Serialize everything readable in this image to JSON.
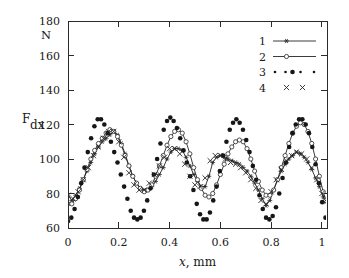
{
  "chart_data": {
    "type": "line",
    "title": "",
    "xlabel": "x, mm",
    "ylabel": "F_dx",
    "ylabel_main": "F",
    "ylabel_sub": "dx",
    "yunit": "N",
    "xlim": [
      0,
      1.02
    ],
    "ylim": [
      60,
      180
    ],
    "xticks": [
      0,
      0.2,
      0.4,
      0.6,
      0.8,
      1
    ],
    "xticklabels": [
      "0",
      "0.2",
      "0.4",
      "0.6",
      "0.8",
      "1"
    ],
    "yticks": [
      60,
      80,
      100,
      120,
      140,
      160,
      180
    ],
    "yticklabels": [
      "60",
      "80",
      "100",
      "120",
      "140",
      "160",
      "180"
    ],
    "grid": false,
    "legend_position": "top-right",
    "legend": [
      {
        "label": "1",
        "marker": "star",
        "line": "solid"
      },
      {
        "label": "2",
        "marker": "circle-open",
        "line": "solid"
      },
      {
        "label": "3",
        "marker": "dot-filled",
        "line": "dotted"
      },
      {
        "label": "4",
        "marker": "cross",
        "line": "none"
      }
    ],
    "series": [
      {
        "name": "1",
        "marker": "star",
        "line": "solid",
        "x": [
          0.0,
          0.015,
          0.03,
          0.045,
          0.06,
          0.075,
          0.09,
          0.105,
          0.12,
          0.135,
          0.15,
          0.165,
          0.18,
          0.195,
          0.21,
          0.225,
          0.24,
          0.255,
          0.27,
          0.285,
          0.3,
          0.315,
          0.33,
          0.345,
          0.36,
          0.375,
          0.39,
          0.405,
          0.42,
          0.435,
          0.45,
          0.465,
          0.48,
          0.495,
          0.51,
          0.525,
          0.54,
          0.555,
          0.57,
          0.585,
          0.6,
          0.615,
          0.63,
          0.645,
          0.66,
          0.675,
          0.69,
          0.705,
          0.72,
          0.735,
          0.75,
          0.765,
          0.78,
          0.795,
          0.81,
          0.825,
          0.84,
          0.855,
          0.87,
          0.885,
          0.9,
          0.915,
          0.93,
          0.945,
          0.96,
          0.975,
          0.99,
          1.005,
          1.015
        ],
        "y": [
          79,
          76,
          79,
          83,
          88,
          93,
          98,
          103,
          107,
          110,
          112,
          114,
          116,
          114,
          109,
          103,
          96,
          90,
          86,
          83,
          82,
          82,
          84,
          87,
          91,
          95,
          100,
          104,
          106,
          106,
          105,
          101,
          96,
          91,
          87,
          84,
          84,
          90,
          98,
          101,
          102,
          101,
          100,
          99,
          98,
          97,
          95,
          93,
          90,
          86,
          82,
          77,
          73,
          76,
          82,
          88,
          93,
          97,
          100,
          102,
          104,
          103,
          101,
          98,
          94,
          89,
          84,
          78,
          75
        ]
      },
      {
        "name": "2",
        "marker": "circle-open",
        "line": "solid",
        "x": [
          0.0,
          0.015,
          0.03,
          0.045,
          0.06,
          0.075,
          0.09,
          0.105,
          0.12,
          0.135,
          0.15,
          0.165,
          0.18,
          0.195,
          0.21,
          0.225,
          0.24,
          0.255,
          0.27,
          0.285,
          0.3,
          0.315,
          0.33,
          0.345,
          0.36,
          0.375,
          0.39,
          0.405,
          0.42,
          0.435,
          0.45,
          0.465,
          0.48,
          0.495,
          0.51,
          0.525,
          0.54,
          0.555,
          0.57,
          0.585,
          0.6,
          0.615,
          0.63,
          0.645,
          0.66,
          0.675,
          0.69,
          0.705,
          0.72,
          0.735,
          0.75,
          0.765,
          0.78,
          0.795,
          0.81,
          0.825,
          0.84,
          0.855,
          0.87,
          0.885,
          0.9,
          0.915,
          0.93,
          0.945,
          0.96,
          0.975,
          0.99,
          1.005,
          1.015
        ],
        "y": [
          74,
          74,
          77,
          82,
          88,
          94,
          100,
          105,
          109,
          112,
          115,
          117,
          116,
          113,
          108,
          102,
          96,
          90,
          86,
          83,
          81,
          82,
          85,
          90,
          96,
          102,
          108,
          113,
          116,
          117,
          115,
          110,
          103,
          95,
          88,
          83,
          79,
          78,
          80,
          85,
          91,
          97,
          103,
          107,
          110,
          111,
          110,
          106,
          100,
          93,
          87,
          82,
          79,
          79,
          82,
          88,
          95,
          102,
          109,
          115,
          119,
          121,
          120,
          116,
          109,
          100,
          90,
          81,
          76
        ]
      },
      {
        "name": "3",
        "marker": "dot-filled",
        "line": "dotted",
        "x": [
          0.0,
          0.013,
          0.026,
          0.039,
          0.052,
          0.065,
          0.078,
          0.091,
          0.104,
          0.117,
          0.13,
          0.143,
          0.156,
          0.169,
          0.182,
          0.195,
          0.208,
          0.221,
          0.234,
          0.247,
          0.26,
          0.273,
          0.286,
          0.299,
          0.312,
          0.325,
          0.338,
          0.351,
          0.364,
          0.377,
          0.39,
          0.403,
          0.416,
          0.429,
          0.442,
          0.455,
          0.468,
          0.481,
          0.494,
          0.507,
          0.52,
          0.533,
          0.546,
          0.559,
          0.572,
          0.585,
          0.598,
          0.611,
          0.624,
          0.637,
          0.65,
          0.663,
          0.676,
          0.689,
          0.702,
          0.715,
          0.728,
          0.741,
          0.754,
          0.767,
          0.78,
          0.793,
          0.806,
          0.819,
          0.832,
          0.845,
          0.858,
          0.871,
          0.884,
          0.897,
          0.91,
          0.923,
          0.936,
          0.949,
          0.962,
          0.975,
          0.988,
          1.001,
          1.014
        ],
        "y": [
          64,
          66,
          71,
          78,
          86,
          95,
          104,
          112,
          119,
          123,
          123,
          120,
          115,
          110,
          104,
          98,
          91,
          84,
          77,
          70,
          66,
          65,
          66,
          70,
          76,
          83,
          91,
          100,
          109,
          117,
          122,
          124,
          122,
          118,
          112,
          105,
          98,
          90,
          82,
          74,
          68,
          65,
          65,
          69,
          76,
          84,
          93,
          102,
          110,
          117,
          121,
          123,
          121,
          117,
          111,
          104,
          96,
          88,
          79,
          71,
          66,
          65,
          67,
          72,
          80,
          89,
          98,
          107,
          115,
          120,
          123,
          123,
          120,
          115,
          107,
          97,
          86,
          75,
          66
        ]
      },
      {
        "name": "4",
        "marker": "cross",
        "line": "none",
        "x": [
          0.0,
          0.02,
          0.04,
          0.06,
          0.08,
          0.1,
          0.12,
          0.14,
          0.16,
          0.18,
          0.2,
          0.22,
          0.24,
          0.26,
          0.28,
          0.3,
          0.32,
          0.34,
          0.36,
          0.38,
          0.4,
          0.42,
          0.44,
          0.46,
          0.48,
          0.5,
          0.52,
          0.54,
          0.56,
          0.58,
          0.6,
          0.62,
          0.64,
          0.66,
          0.68,
          0.7,
          0.72,
          0.74,
          0.76,
          0.78,
          0.8,
          0.82,
          0.84,
          0.86,
          0.88,
          0.9,
          0.92,
          0.94,
          0.96,
          0.98,
          1.0,
          1.015
        ],
        "y": [
          79,
          77,
          81,
          88,
          95,
          102,
          107,
          112,
          116,
          116,
          110,
          101,
          92,
          85,
          82,
          82,
          86,
          91,
          96,
          101,
          106,
          106,
          103,
          97,
          90,
          85,
          84,
          89,
          99,
          102,
          102,
          100,
          98,
          97,
          95,
          92,
          88,
          83,
          76,
          74,
          81,
          88,
          94,
          99,
          102,
          104,
          103,
          100,
          95,
          88,
          80,
          76
        ]
      }
    ]
  }
}
